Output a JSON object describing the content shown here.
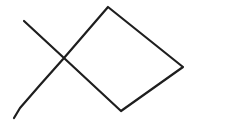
{
  "drawing": {
    "subject": "fish",
    "background": "#ffffff",
    "stroke_color": "#1e1e1e",
    "stroke_width": 2.2,
    "strokes": [
      {
        "name": "body-and-tail",
        "points": "24,21 64,58 121,111 183,67 108,7 64,58 40,85 20,108 14,118"
      }
    ]
  }
}
